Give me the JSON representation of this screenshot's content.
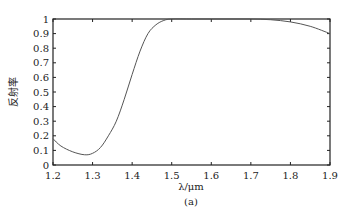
{
  "chart_data": {
    "type": "line",
    "title": "",
    "xlabel": "λ/μm",
    "ylabel": "反射率",
    "caption": "(a)",
    "xlim": [
      1.2,
      1.9
    ],
    "ylim": [
      0,
      1
    ],
    "grid": false,
    "legend": null,
    "xticks": [
      "1.2",
      "1.3",
      "1.4",
      "1.5",
      "1.6",
      "1.7",
      "1.8",
      "1.9"
    ],
    "yticks": [
      "0",
      "0.1",
      "0.2",
      "0.3",
      "0.4",
      "0.5",
      "0.6",
      "0.7",
      "0.8",
      "0.9",
      "1"
    ],
    "series": [
      {
        "name": "reflectance",
        "color": "#555555",
        "x": [
          1.2,
          1.22,
          1.25,
          1.28,
          1.3,
          1.32,
          1.34,
          1.36,
          1.38,
          1.4,
          1.42,
          1.44,
          1.46,
          1.48,
          1.5,
          1.55,
          1.6,
          1.65,
          1.7,
          1.75,
          1.8,
          1.85,
          1.9
        ],
        "values": [
          0.18,
          0.13,
          0.09,
          0.07,
          0.08,
          0.12,
          0.2,
          0.3,
          0.45,
          0.62,
          0.78,
          0.9,
          0.96,
          0.99,
          1.0,
          1.0,
          1.0,
          1.0,
          1.0,
          0.995,
          0.98,
          0.95,
          0.9
        ]
      }
    ]
  },
  "layout": {
    "frame": {
      "left": 53,
      "top": 19,
      "right": 330,
      "bottom": 165
    }
  }
}
